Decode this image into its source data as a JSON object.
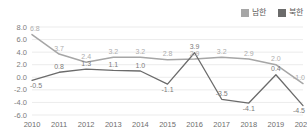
{
  "legend": {
    "position": "top-right",
    "items": [
      {
        "label": "남한",
        "color": "#a6a6a6",
        "icon": "square-swatch"
      },
      {
        "label": "북한",
        "color": "#6b6b6b",
        "icon": "square-swatch"
      }
    ]
  },
  "chart_data": {
    "type": "line",
    "title": "",
    "subtitle": "",
    "xlabel": "",
    "ylabel": "",
    "categories": [
      "2010",
      "2011",
      "2012",
      "2013",
      "2014",
      "2015",
      "2016",
      "2017",
      "2018",
      "2019",
      "2020"
    ],
    "ylim": [
      -6.0,
      8.0
    ],
    "yticks": [
      "8.0",
      "6.0",
      "4.0",
      "2.0",
      "0.0",
      "-2.0",
      "-4.0",
      "-6.0"
    ],
    "ytick_values": [
      8.0,
      6.0,
      4.0,
      2.0,
      0.0,
      -2.0,
      -4.0,
      -6.0
    ],
    "grid": true,
    "grid_axis": "y",
    "legend_position": "top-right",
    "series": [
      {
        "name": "남한",
        "color": "#a6a6a6",
        "values": [
          6.8,
          3.7,
          2.4,
          3.2,
          3.2,
          2.8,
          2.9,
          3.2,
          2.9,
          2.0,
          -1.0
        ],
        "labels": [
          "6.8",
          "3.7",
          "2.4",
          "3.2",
          "3.2",
          "2.8",
          "2.9",
          "3.2",
          "2.9",
          "2.0",
          "-1.0"
        ]
      },
      {
        "name": "북한",
        "color": "#6b6b6b",
        "values": [
          -0.5,
          0.8,
          1.3,
          1.1,
          1.0,
          -1.1,
          3.9,
          -3.5,
          -4.1,
          0.4,
          -4.5
        ],
        "labels": [
          "-0.5",
          "0.8",
          "1.3",
          "1.1",
          "1.0",
          "-1.1",
          "3.9",
          "-3.5",
          "-4.1",
          "0.4",
          "-4.5"
        ]
      }
    ]
  }
}
